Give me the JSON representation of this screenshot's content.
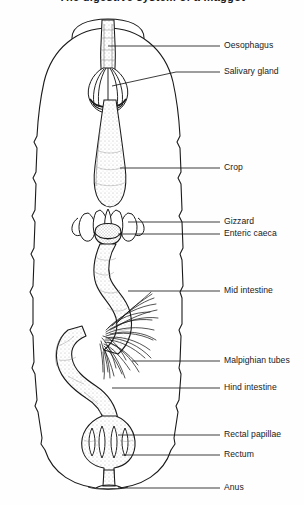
{
  "figure": {
    "title": "The digestive system of a maggot",
    "title_clipped": true,
    "width": 304,
    "height": 505,
    "ink_color": "#1a1a1a",
    "background_color": "#fefefe"
  },
  "labels": [
    {
      "id": "oesophagus",
      "text": "Oesophagus",
      "text_x": 224,
      "text_y": 46,
      "leader_x1": 196,
      "leader_x2": 220,
      "leader_y": 46,
      "target_x": 108,
      "target_y": 46
    },
    {
      "id": "salivary-gland",
      "text": "Salivary gland",
      "text_x": 224,
      "text_y": 72,
      "leader_x1": 176,
      "leader_x2": 220,
      "leader_y": 72,
      "target_x": 112,
      "target_y": 86
    },
    {
      "id": "crop",
      "text": "Crop",
      "text_x": 224,
      "text_y": 168,
      "leader_x1": 120,
      "leader_x2": 220,
      "leader_y": 168,
      "target_x": 120,
      "target_y": 168
    },
    {
      "id": "gizzard",
      "text": "Gizzard",
      "text_x": 224,
      "text_y": 222,
      "leader_x1": 128,
      "leader_x2": 220,
      "leader_y": 222,
      "target_x": 128,
      "target_y": 222
    },
    {
      "id": "enteric-caeca",
      "text": "Enteric caeca",
      "text_x": 224,
      "text_y": 234,
      "leader_x1": 118,
      "leader_x2": 220,
      "leader_y": 234,
      "target_x": 118,
      "target_y": 234
    },
    {
      "id": "mid-intestine",
      "text": "Mid intestine",
      "text_x": 224,
      "text_y": 291,
      "leader_x1": 128,
      "leader_x2": 220,
      "leader_y": 291,
      "target_x": 128,
      "target_y": 291
    },
    {
      "id": "malpighian-tubes",
      "text": "Malpighian tubes",
      "text_x": 224,
      "text_y": 361,
      "leader_x1": 132,
      "leader_x2": 220,
      "leader_y": 361,
      "target_x": 132,
      "target_y": 361
    },
    {
      "id": "hind-intestine",
      "text": "Hind intestine",
      "text_x": 224,
      "text_y": 388,
      "leader_x1": 112,
      "leader_x2": 220,
      "leader_y": 388,
      "target_x": 112,
      "target_y": 388
    },
    {
      "id": "rectal-papillae",
      "text": "Rectal papillae",
      "text_x": 224,
      "text_y": 435,
      "leader_x1": 118,
      "leader_x2": 220,
      "leader_y": 435,
      "target_x": 118,
      "target_y": 435
    },
    {
      "id": "rectum",
      "text": "Rectum",
      "text_x": 224,
      "text_y": 455,
      "leader_x1": 122,
      "leader_x2": 220,
      "leader_y": 455,
      "target_x": 122,
      "target_y": 455
    },
    {
      "id": "anus",
      "text": "Anus",
      "text_x": 224,
      "text_y": 488,
      "leader_x1": 118,
      "leader_x2": 220,
      "leader_y": 488,
      "target_x": 118,
      "target_y": 488
    }
  ],
  "anatomy": {
    "body_outline": {
      "name": "larval body wall",
      "segment_count": 10,
      "top_y": 28,
      "bottom_y": 490
    },
    "head_capsule": {
      "name": "pseudocephalon",
      "cx": 108,
      "cy": 36
    },
    "oesophagus": {
      "name": "oesophagus",
      "from_y": 20,
      "to_y": 100
    },
    "salivary_gland": {
      "name": "salivary gland",
      "cy": 86
    },
    "crop": {
      "name": "crop",
      "cy": 170
    },
    "gizzard": {
      "name": "gizzard / proventriculus",
      "cy": 228
    },
    "enteric_caeca": {
      "name": "enteric caeca",
      "cy": 232,
      "count": 8
    },
    "mid_intestine": {
      "name": "mid intestine",
      "from_y": 245,
      "to_y": 350
    },
    "malpighian": {
      "name": "Malpighian tubules",
      "cy": 350,
      "filament_count": 26
    },
    "hind_intestine": {
      "name": "hind intestine",
      "from_y": 350,
      "to_y": 415
    },
    "rectum": {
      "name": "rectum",
      "cy": 445
    },
    "rectal_papillae": {
      "name": "rectal papillae",
      "count": 4,
      "cy": 443
    },
    "anus": {
      "name": "anus",
      "cy": 487
    }
  }
}
